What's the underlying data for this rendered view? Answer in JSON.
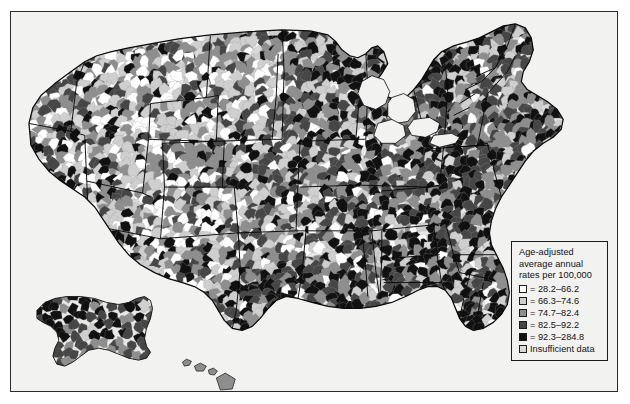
{
  "figure": {
    "width": 630,
    "height": 404,
    "background_color": "#ffffff",
    "map_plate_color": "#f2f2f0",
    "frame_color": "#2b2b2b",
    "county_border_color": "#9a9a9a",
    "state_border_color": "#000000"
  },
  "legend": {
    "title_lines": [
      "Age-adjusted",
      "average annual",
      "rates per 100,000"
    ],
    "border_color": "#1c1c1c",
    "background_color": "#f2f2f0",
    "entries": [
      {
        "swatch_name": "legend-swatch-class-1",
        "color": "#ffffff",
        "prefix": "=",
        "label": "= 28.2–66.2",
        "range_low": 28.2,
        "range_high": 66.2
      },
      {
        "swatch_name": "legend-swatch-class-2",
        "color": "#cfcfcf",
        "prefix": "=",
        "label": "= 66.3–74.6",
        "range_low": 66.3,
        "range_high": 74.6
      },
      {
        "swatch_name": "legend-swatch-class-3",
        "color": "#8e8e8e",
        "prefix": "=",
        "label": "= 74.7–82.4",
        "range_low": 74.7,
        "range_high": 82.4
      },
      {
        "swatch_name": "legend-swatch-class-4",
        "color": "#464646",
        "prefix": "=",
        "label": "= 82.5–92.2",
        "range_low": 82.5,
        "range_high": 92.2
      },
      {
        "swatch_name": "legend-swatch-class-5",
        "color": "#111111",
        "prefix": "=",
        "label": "= 92.3–284.8",
        "range_low": 92.3,
        "range_high": 284.8
      },
      {
        "swatch_name": "legend-swatch-insufficient",
        "color": "#d9d9d9",
        "prefix": "",
        "label": "Insufficient data",
        "range_low": null,
        "range_high": null
      }
    ]
  },
  "chart_data": {
    "type": "heatmap",
    "title": "Age-adjusted average annual rates per 100,000",
    "subtitle": "",
    "xlabel": "",
    "ylabel": "",
    "map_projection": "albers-usa",
    "legend_position": "bottom-right",
    "grid": false,
    "value_unit": "rate per 100,000",
    "classes": [
      {
        "index": 1,
        "label": "28.2–66.2",
        "color": "#ffffff",
        "low": 28.2,
        "high": 66.2
      },
      {
        "index": 2,
        "label": "66.3–74.6",
        "color": "#cfcfcf",
        "low": 66.3,
        "high": 74.6
      },
      {
        "index": 3,
        "label": "74.7–82.4",
        "color": "#8e8e8e",
        "low": 74.7,
        "high": 82.4
      },
      {
        "index": 4,
        "label": "82.5–92.2",
        "color": "#464646",
        "low": 82.5,
        "high": 92.2
      },
      {
        "index": 5,
        "label": "92.3–284.8",
        "color": "#111111",
        "low": 92.3,
        "high": 284.8
      },
      {
        "index": 0,
        "label": "Insufficient data",
        "color": "#d9d9d9",
        "low": null,
        "high": null
      }
    ],
    "regional_summary": [
      {
        "region": "Pacific Northwest",
        "dominant_class": 3
      },
      {
        "region": "California coast",
        "dominant_class": 4
      },
      {
        "region": "Interior West / Great Basin",
        "dominant_class": 1
      },
      {
        "region": "Northern Plains",
        "dominant_class": 2
      },
      {
        "region": "Upper Midwest",
        "dominant_class": 2
      },
      {
        "region": "Great Lakes / Ohio Valley",
        "dominant_class": 4
      },
      {
        "region": "Northeast / New England",
        "dominant_class": 3
      },
      {
        "region": "Mid-Atlantic",
        "dominant_class": 4
      },
      {
        "region": "Southeast",
        "dominant_class": 5
      },
      {
        "region": "Mississippi Delta",
        "dominant_class": 5
      },
      {
        "region": "Texas",
        "dominant_class": 4
      },
      {
        "region": "Florida peninsula",
        "dominant_class": 2
      },
      {
        "region": "Alaska",
        "dominant_class": 5
      },
      {
        "region": "Hawaii",
        "dominant_class": 3
      }
    ]
  }
}
